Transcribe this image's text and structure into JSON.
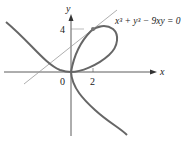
{
  "figure": {
    "equation": "x³ + y³ − 9xy = 0",
    "axes": {
      "x_label": "x",
      "y_label": "y",
      "origin_label": "0",
      "x_tick_label": "2",
      "y_tick_label": "4"
    },
    "curve": "folium of Descartes",
    "tangent_point": "(2, 4)",
    "colors": {
      "curve": "#666666",
      "tangent_line": "#999999",
      "axes": "#333333",
      "point": "#777777"
    }
  }
}
